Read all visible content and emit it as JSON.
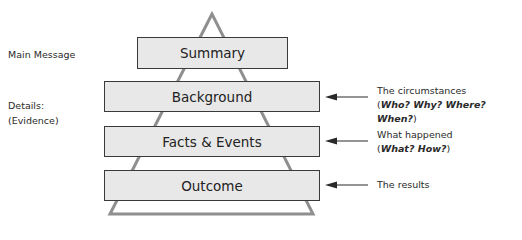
{
  "left_labels": {
    "main_message": "Main Message",
    "details_line1": "Details:",
    "details_line2": "(Evidence)"
  },
  "boxes": [
    {
      "label": "Summary"
    },
    {
      "label": "Background"
    },
    {
      "label": "Facts & Events"
    },
    {
      "label": "Outcome"
    }
  ],
  "annotations": [
    {
      "line1": "The circumstances",
      "open": "(",
      "line2_italic": "Who? Why? Where? When?",
      "close": ")"
    },
    {
      "line1": "What happened",
      "open": "(",
      "line2_italic": "What? How?",
      "close": ")"
    },
    {
      "line1": "The results"
    }
  ],
  "colors": {
    "box_fill": "#e8e8e8",
    "box_border": "#3a3a3a",
    "triangle": "#8f8f8f",
    "arrow": "#2a2a2a"
  }
}
